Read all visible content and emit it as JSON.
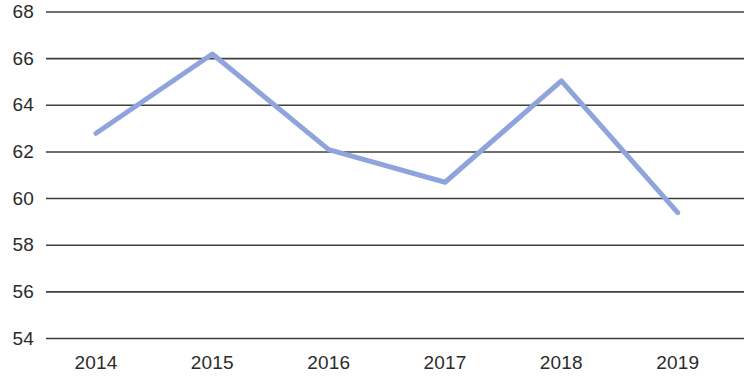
{
  "chart_data": {
    "type": "line",
    "title": "",
    "subtitle": "",
    "xlabel": "",
    "ylabel": "",
    "categories": [
      "2014",
      "2015",
      "2016",
      "2017",
      "2018",
      "2019"
    ],
    "values": [
      62.8,
      66.2,
      62.1,
      60.7,
      65.05,
      59.4
    ],
    "series": [
      {
        "name": "",
        "values": [
          62.8,
          66.2,
          62.1,
          60.7,
          65.05,
          59.4
        ],
        "color": "#8fa4dc"
      }
    ],
    "ylim": [
      54,
      68
    ],
    "yticks": [
      54,
      56,
      58,
      60,
      62,
      64,
      66,
      68
    ],
    "ytick_labels": [
      "54",
      "56",
      "58",
      "60",
      "62",
      "64",
      "66",
      "68"
    ],
    "xtick_labels": [
      "2014",
      "2015",
      "2016",
      "2017",
      "2018",
      "2019"
    ],
    "grid": {
      "horizontal": true,
      "vertical": false,
      "color": "#3f3f3f"
    },
    "legend": {
      "visible": false,
      "position": "none",
      "entries": []
    },
    "markers": false,
    "line_width": 5,
    "colors": {
      "line": "#8fa4dc",
      "gridline": "#3f3f3f",
      "text": "#2b2b2b",
      "background": "#ffffff"
    }
  },
  "axes": {
    "y": {
      "ticks": [
        {
          "label": "68",
          "value": 68
        },
        {
          "label": "66",
          "value": 66
        },
        {
          "label": "64",
          "value": 64
        },
        {
          "label": "62",
          "value": 62
        },
        {
          "label": "60",
          "value": 60
        },
        {
          "label": "58",
          "value": 58
        },
        {
          "label": "56",
          "value": 56
        },
        {
          "label": "54",
          "value": 54
        }
      ]
    },
    "x": {
      "ticks": [
        {
          "label": "2014"
        },
        {
          "label": "2015"
        },
        {
          "label": "2016"
        },
        {
          "label": "2017"
        },
        {
          "label": "2018"
        },
        {
          "label": "2019"
        }
      ]
    }
  }
}
